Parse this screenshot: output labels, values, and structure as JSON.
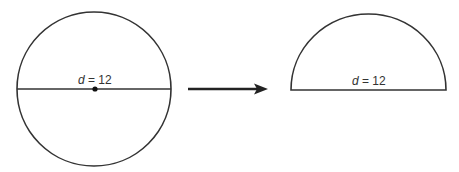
{
  "diagram": {
    "left_figure": {
      "shape": "circle",
      "label_var": "d",
      "label_eq": " = 12",
      "has_center_point": true
    },
    "arrow": {
      "direction": "right"
    },
    "right_figure": {
      "shape": "semicircle",
      "label_var": "d",
      "label_eq": " = 12"
    },
    "colors": {
      "stroke": "#333333",
      "background": "#ffffff"
    }
  }
}
